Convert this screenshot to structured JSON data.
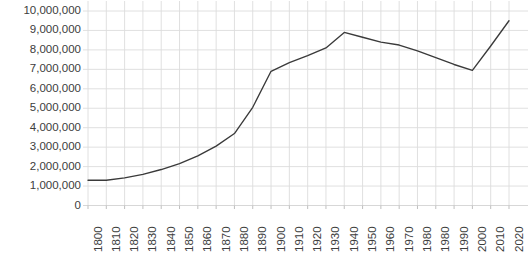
{
  "chart_data": {
    "type": "line",
    "title": "",
    "subtitle": "",
    "xlabel": "",
    "ylabel": "",
    "grid": true,
    "legend": null,
    "legend_position": "none",
    "line_color": "#3a3a3a",
    "grid_color": "#dcdcdc",
    "axis_text_color": "#3c3c3c",
    "xlim": [
      1800,
      2020
    ],
    "ylim": [
      0,
      10000000
    ],
    "ytick_labels": [
      "10,000,000",
      "9,000,000",
      "8,000,000",
      "7,000,000",
      "6,000,000",
      "5,000,000",
      "4,000,000",
      "3,000,000",
      "2,000,000",
      "1,000,000",
      "0"
    ],
    "ytick_values": [
      10000000,
      9000000,
      8000000,
      7000000,
      6000000,
      5000000,
      4000000,
      3000000,
      2000000,
      1000000,
      0
    ],
    "xtick_labels": [
      "1800",
      "1810",
      "1820",
      "1830",
      "1840",
      "1850",
      "1860",
      "1870",
      "1880",
      "1890",
      "1900",
      "1910",
      "1920",
      "1930",
      "1940",
      "1950",
      "1960",
      "1970",
      "1980",
      "1980",
      "1990",
      "2000",
      "2010",
      "2020"
    ],
    "categories": [
      "1800",
      "1810",
      "1820",
      "1830",
      "1840",
      "1850",
      "1860",
      "1870",
      "1880",
      "1890",
      "1900",
      "1910",
      "1920",
      "1930",
      "1940",
      "1950",
      "1960",
      "1970",
      "1980",
      "1980",
      "1990",
      "2000",
      "2010",
      "2020"
    ],
    "values": [
      1300000,
      1300000,
      1420000,
      1600000,
      1850000,
      2150000,
      2550000,
      3050000,
      3700000,
      5050000,
      6900000,
      7350000,
      7700000,
      8100000,
      8900000,
      8650000,
      8400000,
      8250000,
      7950000,
      7600000,
      7250000,
      6950000,
      8200000,
      9500000
    ]
  }
}
